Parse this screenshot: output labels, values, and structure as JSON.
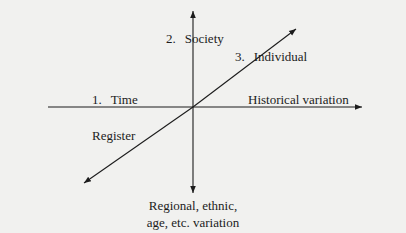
{
  "diagram": {
    "type": "three-axis dimensions of variation",
    "colors": {
      "background": "#f1f1ef",
      "ink": "#1c1c1c"
    },
    "axes": [
      {
        "id": "time",
        "number": "1.",
        "name": "Time",
        "variation_label": "Historical variation",
        "direction": "horizontal"
      },
      {
        "id": "society",
        "number": "2.",
        "name": "Society",
        "variation_label_line1": "Regional, ethnic,",
        "variation_label_line2": "age, etc. variation",
        "direction": "vertical"
      },
      {
        "id": "individual",
        "number": "3.",
        "name": "Individual",
        "variation_label": "Register",
        "direction": "diagonal"
      }
    ]
  }
}
